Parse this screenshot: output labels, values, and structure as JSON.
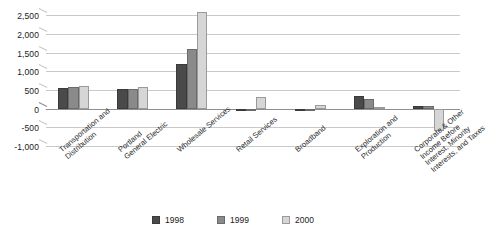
{
  "chart_data": {
    "type": "bar",
    "title": "",
    "subtitle": "",
    "xlabel": "",
    "ylabel": "",
    "ylim": [
      -1000,
      2750
    ],
    "yticks": [
      -1000,
      -500,
      0,
      500,
      1000,
      1500,
      2000,
      2500
    ],
    "ytick_labels": [
      "-1,000",
      "-500",
      "0",
      "500",
      "1,000",
      "1,500",
      "2,000",
      "2,500"
    ],
    "grid": true,
    "legend_position": "bottom",
    "categories": [
      "Transportation and\nDistribution",
      "Portland\nGeneral Electric",
      "Wholesale Services",
      "Retail Services",
      "Broadband",
      "Exploration and\nProduction",
      "Corporate & Other\nIncome Before\nInterest, Minority\nInterests, and Taxes"
    ],
    "series": [
      {
        "name": "1998",
        "color": "#4a4a4a",
        "values": [
          545,
          530,
          1200,
          -50,
          0,
          350,
          75
        ]
      },
      {
        "name": "1999",
        "color": "#8a8a8a",
        "values": [
          580,
          520,
          1600,
          -60,
          0,
          260,
          60
        ]
      },
      {
        "name": "2000",
        "color": "#d6d6d6",
        "values": [
          605,
          580,
          2600,
          310,
          100,
          40,
          -590
        ]
      }
    ]
  },
  "legend": {
    "items": [
      {
        "label": "1998",
        "swatch_class": "s1998"
      },
      {
        "label": "1999",
        "swatch_class": "s1999"
      },
      {
        "label": "2000",
        "swatch_class": "s2000"
      }
    ]
  }
}
